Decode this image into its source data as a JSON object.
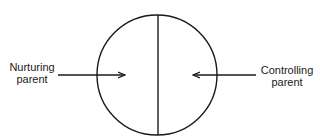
{
  "diagram": {
    "left_label": {
      "line1": "Nurturing",
      "line2": "parent"
    },
    "right_label": {
      "line1": "Controlling",
      "line2": "parent"
    },
    "stroke_color": "#1a1a1a"
  }
}
